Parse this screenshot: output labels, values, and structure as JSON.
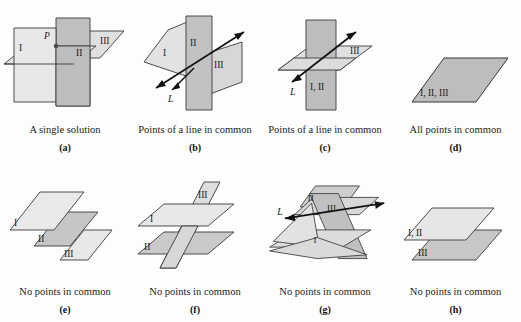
{
  "figure": {
    "background_color": "#fdfdfd",
    "stroke_color": "#3a3a3a",
    "label_color": "#1a1a1a",
    "plane_fill_light": "#e6e6e6",
    "plane_fill_mid": "#d4d4d4",
    "plane_fill_dark": "#b9b9b9",
    "plane_fill_darker": "#a8a8a8"
  },
  "panels": [
    {
      "id": "a",
      "letter": "(a)",
      "caption": "A single solution",
      "plane_labels": [
        "I",
        "II",
        "III"
      ],
      "point_label": "P",
      "line_label": ""
    },
    {
      "id": "b",
      "letter": "(b)",
      "caption": "Points of a line in common",
      "plane_labels": [
        "I",
        "II",
        "III"
      ],
      "point_label": "",
      "line_label": "L"
    },
    {
      "id": "c",
      "letter": "(c)",
      "caption": "Points of a line in common",
      "plane_labels": [
        "I, II",
        "III"
      ],
      "point_label": "",
      "line_label": "L"
    },
    {
      "id": "d",
      "letter": "(d)",
      "caption": "All points in common",
      "plane_labels": [
        "I, II, III"
      ],
      "point_label": "",
      "line_label": ""
    },
    {
      "id": "e",
      "letter": "(e)",
      "caption": "No points in common",
      "plane_labels": [
        "I",
        "II",
        "III"
      ],
      "point_label": "",
      "line_label": ""
    },
    {
      "id": "f",
      "letter": "(f)",
      "caption": "No points in common",
      "plane_labels": [
        "I",
        "II",
        "III"
      ],
      "point_label": "",
      "line_label": ""
    },
    {
      "id": "g",
      "letter": "(g)",
      "caption": "No points in common",
      "plane_labels": [
        "I",
        "II",
        "III"
      ],
      "point_label": "",
      "line_label": "L"
    },
    {
      "id": "h",
      "letter": "(h)",
      "caption": "No points in common",
      "plane_labels": [
        "I, II",
        "III"
      ],
      "point_label": "",
      "line_label": ""
    }
  ]
}
